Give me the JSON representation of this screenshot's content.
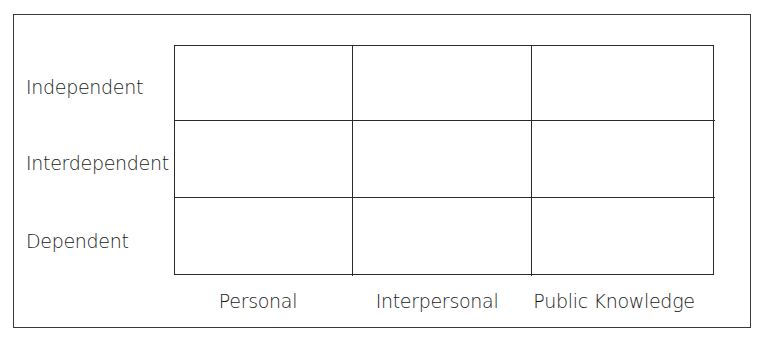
{
  "diagram": {
    "type": "matrix",
    "rows": [
      {
        "label": "Independent"
      },
      {
        "label": "Interdependent"
      },
      {
        "label": "Dependent"
      }
    ],
    "columns": [
      {
        "label": "Personal"
      },
      {
        "label": "Interpersonal"
      },
      {
        "label": "Public Knowledge"
      }
    ],
    "cells": [
      [
        "",
        "",
        ""
      ],
      [
        "",
        "",
        ""
      ],
      [
        "",
        "",
        ""
      ]
    ]
  }
}
